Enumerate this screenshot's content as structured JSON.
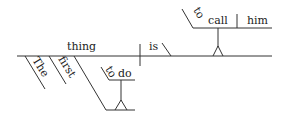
{
  "sentence": "The first thing to do is to call him",
  "diagram": {
    "type": "reed-kellogg",
    "subject": "thing",
    "verb": "is",
    "predicate_nominative": {
      "infinitive_marker": "to",
      "verb": "call",
      "object": "him"
    },
    "modifiers": {
      "article": "The",
      "adjective": "first",
      "infinitive_phrase": {
        "marker": "to",
        "verb": "do"
      }
    }
  },
  "colors": {
    "line": "#333333",
    "text": "#222222",
    "background": "#ffffff"
  }
}
